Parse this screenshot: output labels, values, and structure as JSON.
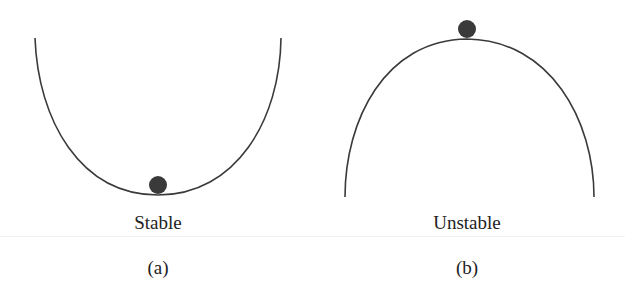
{
  "panels": [
    {
      "id": "a",
      "state_label": "Stable",
      "caption": "(a)",
      "curve": "valley",
      "ball_position": "bottom"
    },
    {
      "id": "b",
      "state_label": "Unstable",
      "caption": "(b)",
      "curve": "hill",
      "ball_position": "top"
    }
  ],
  "colors": {
    "curve": "#3a3a3a",
    "ball": "#3a3a3a"
  }
}
